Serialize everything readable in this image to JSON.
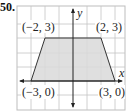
{
  "problem": {
    "number": "50."
  },
  "graph": {
    "x_axis_label": "x",
    "y_axis_label": "y",
    "grid": {
      "x_min": -4,
      "x_max": 4,
      "y_min": -2,
      "y_max": 5,
      "step": 1,
      "visible": true
    },
    "shape": {
      "type": "trapezoid",
      "fill_color": "#d9d9d9",
      "stroke_color": "#333333",
      "vertices": [
        {
          "x": -3,
          "y": 0,
          "label": "(−3, 0)"
        },
        {
          "x": -2,
          "y": 3,
          "label": "(−2, 3)"
        },
        {
          "x": 2,
          "y": 3,
          "label": "(2, 3)"
        },
        {
          "x": 3,
          "y": 0,
          "label": "(3, 0)"
        }
      ]
    },
    "colors": {
      "grid": "#bdbdbd",
      "axis": "#222222"
    }
  }
}
